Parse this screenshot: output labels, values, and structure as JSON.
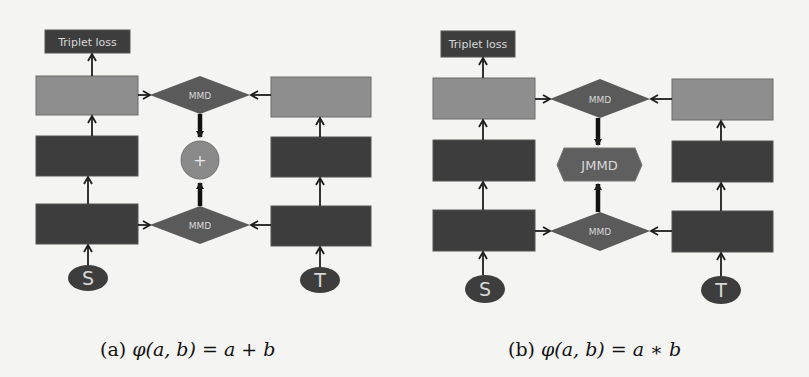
{
  "colors": {
    "dark_box": "#3d3d3d",
    "light_box": "#8e8e8e",
    "diamond": "#5a5a5a",
    "plus_circle": "#8a8a8a",
    "hexagon": "#5f5f5f",
    "arrow": "#1e1e1e",
    "background": "#f4f4f2",
    "label_text": "#d8d8d8"
  },
  "panels": [
    {
      "id": "a",
      "loss_label": "Triplet loss",
      "top_fusion_label": "MMD",
      "bottom_fusion_label": "MMD",
      "combiner_type": "circle",
      "combiner_label": "+",
      "source_label": "S",
      "target_label": "T",
      "caption_prefix": "(a)",
      "caption_formula": "φ(a, b) = a + b"
    },
    {
      "id": "b",
      "loss_label": "Triplet loss",
      "top_fusion_label": "MMD",
      "bottom_fusion_label": "MMD",
      "combiner_type": "hexagon",
      "combiner_label": "JMMD",
      "source_label": "S",
      "target_label": "T",
      "caption_prefix": "(b)",
      "caption_formula": "φ(a, b) = a ∗ b"
    }
  ]
}
